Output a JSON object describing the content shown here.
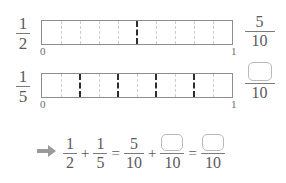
{
  "colors": {
    "background": "#ffffff",
    "text": "#5a5a5a",
    "bar_outline": "#8d8d8d",
    "light_divider": "#cfcfcf",
    "bold_divider": "#2e2e2e",
    "answer_box_border": "#b9b9b9",
    "arrow": "#9a9a9a"
  },
  "rows": [
    {
      "id": "row-half",
      "left_fraction": {
        "numerator": "1",
        "denominator": "2"
      },
      "bar": {
        "segments": 10,
        "start_label": "0",
        "end_label": "1",
        "bold_divider_positions": [
          5
        ]
      },
      "right_fraction": {
        "numerator": "5",
        "denominator": "10",
        "is_answer_box": false
      }
    },
    {
      "id": "row-fifth",
      "left_fraction": {
        "numerator": "1",
        "denominator": "5"
      },
      "bar": {
        "segments": 10,
        "start_label": "0",
        "end_label": "1",
        "bold_divider_positions": [
          2,
          4,
          6,
          8
        ]
      },
      "right_fraction": {
        "numerator": "",
        "denominator": "10",
        "is_answer_box": true
      }
    }
  ],
  "equation": {
    "arrow_icon": "right-arrow-icon",
    "term1": {
      "numerator": "1",
      "denominator": "2"
    },
    "plus": "+",
    "term2": {
      "numerator": "1",
      "denominator": "5"
    },
    "equals1": "=",
    "term3": {
      "numerator": "5",
      "denominator": "10",
      "is_answer_box": false
    },
    "plus2": "+",
    "term4": {
      "numerator": "",
      "denominator": "10",
      "is_answer_box": true
    },
    "equals2": "=",
    "term5": {
      "numerator": "",
      "denominator": "10",
      "is_answer_box": true
    }
  }
}
